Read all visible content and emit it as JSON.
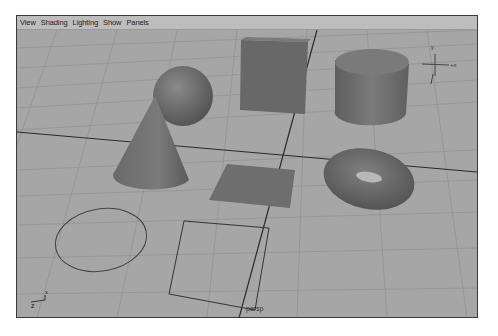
{
  "menubar": {
    "items": [
      {
        "label": "View"
      },
      {
        "label": "Shading"
      },
      {
        "label": "Lighting"
      },
      {
        "label": "Show"
      },
      {
        "label": "Panels"
      }
    ]
  },
  "viewport": {
    "camera_label": "persp",
    "axis_labels": {
      "x": "x",
      "z": "z"
    },
    "view_cube_labels": {
      "y": "y",
      "x": "+x"
    }
  },
  "scene": {
    "objects": [
      {
        "name": "sphere"
      },
      {
        "name": "cube"
      },
      {
        "name": "cylinder"
      },
      {
        "name": "cone"
      },
      {
        "name": "plane"
      },
      {
        "name": "torus"
      },
      {
        "name": "circle-curve"
      },
      {
        "name": "square-curve"
      }
    ]
  },
  "colors": {
    "grid_bg": "#a6a6a6",
    "grid_line": "#8e8e8e",
    "axis_line": "#2a2a2a",
    "object_fill": "#6e6e6e",
    "menubar_bg": "#bdbdbd"
  }
}
